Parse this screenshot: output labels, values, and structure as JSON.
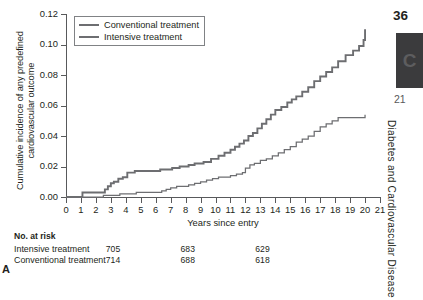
{
  "panel_letter": "A",
  "legend": {
    "items": [
      {
        "label": "Conventional treatment",
        "style": "thick",
        "color": "#6d6e71"
      },
      {
        "label": "Intensive treatment",
        "style": "thin",
        "color": "#6d6e71"
      }
    ]
  },
  "risk_table": {
    "title": "No. at risk",
    "rows": [
      {
        "name": "Intensive treatment",
        "values": [
          "705",
          "683",
          "629",
          "113"
        ]
      },
      {
        "name": "Conventional treatment",
        "values": [
          "714",
          "688",
          "618",
          "92"
        ]
      }
    ],
    "value_years": [
      0,
      5,
      10,
      20
    ]
  },
  "page_edge": {
    "folio": "36",
    "thumb_glyph": "C",
    "chapter_number": "21",
    "running_head": "Diabetes and Cardiovascular Disease"
  },
  "chart_data": {
    "type": "line",
    "title": "",
    "xlabel": "Years since entry",
    "ylabel": "Cumulative incidence of any predefined cardiovascular outcome",
    "xlim": [
      0,
      21
    ],
    "ylim": [
      0.0,
      0.12
    ],
    "xticks": [
      0,
      1,
      2,
      3,
      4,
      5,
      6,
      7,
      8,
      9,
      10,
      11,
      12,
      13,
      14,
      15,
      16,
      17,
      18,
      19,
      20,
      21
    ],
    "yticks": [
      0.0,
      0.02,
      0.04,
      0.06,
      0.08,
      0.1,
      0.12
    ],
    "ytick_labels": [
      "0.00",
      "0.02",
      "0.04",
      "0.06",
      "0.08",
      "0.10",
      "0.12"
    ],
    "grid": false,
    "legend_position": "top-left",
    "step_type": "post",
    "series": [
      {
        "name": "Conventional treatment",
        "color": "#6d6e71",
        "width": 1.9,
        "x": [
          0.0,
          0.9,
          1.1,
          2.4,
          2.6,
          2.8,
          3.0,
          3.2,
          3.5,
          3.8,
          4.1,
          4.6,
          5.6,
          6.3,
          7.1,
          7.6,
          8.2,
          8.6,
          9.2,
          9.7,
          10.2,
          10.6,
          11.0,
          11.3,
          11.6,
          11.9,
          12.2,
          12.5,
          12.8,
          13.1,
          13.4,
          13.7,
          14.0,
          14.4,
          14.8,
          15.1,
          15.4,
          15.8,
          16.2,
          16.6,
          17.0,
          17.4,
          17.8,
          18.2,
          18.7,
          19.2,
          19.6,
          19.9,
          20.0
        ],
        "y": [
          0.0,
          0.0,
          0.003,
          0.003,
          0.005,
          0.007,
          0.009,
          0.01,
          0.012,
          0.013,
          0.016,
          0.017,
          0.017,
          0.018,
          0.019,
          0.02,
          0.021,
          0.022,
          0.023,
          0.025,
          0.027,
          0.029,
          0.031,
          0.033,
          0.035,
          0.037,
          0.04,
          0.042,
          0.045,
          0.048,
          0.051,
          0.054,
          0.057,
          0.059,
          0.062,
          0.064,
          0.066,
          0.069,
          0.072,
          0.076,
          0.079,
          0.082,
          0.085,
          0.089,
          0.093,
          0.096,
          0.099,
          0.103,
          0.11
        ]
      },
      {
        "name": "Intensive treatment",
        "color": "#6d6e71",
        "width": 1.25,
        "x": [
          0.0,
          1.2,
          2.5,
          3.0,
          3.6,
          4.2,
          4.7,
          5.2,
          6.0,
          6.4,
          6.7,
          7.0,
          7.4,
          7.8,
          8.2,
          8.6,
          9.0,
          9.4,
          9.8,
          10.2,
          10.6,
          11.0,
          11.4,
          11.8,
          12.0,
          12.3,
          12.6,
          13.0,
          13.4,
          13.8,
          14.2,
          14.6,
          15.0,
          15.4,
          15.8,
          16.2,
          16.6,
          17.0,
          17.4,
          17.8,
          18.2,
          19.9,
          20.0
        ],
        "y": [
          0.0,
          0.0,
          0.001,
          0.001,
          0.002,
          0.002,
          0.003,
          0.003,
          0.003,
          0.004,
          0.005,
          0.006,
          0.007,
          0.007,
          0.008,
          0.009,
          0.01,
          0.011,
          0.012,
          0.013,
          0.013,
          0.014,
          0.015,
          0.016,
          0.019,
          0.021,
          0.022,
          0.024,
          0.025,
          0.027,
          0.029,
          0.031,
          0.033,
          0.036,
          0.038,
          0.04,
          0.043,
          0.046,
          0.048,
          0.05,
          0.052,
          0.052,
          0.054
        ]
      }
    ]
  }
}
